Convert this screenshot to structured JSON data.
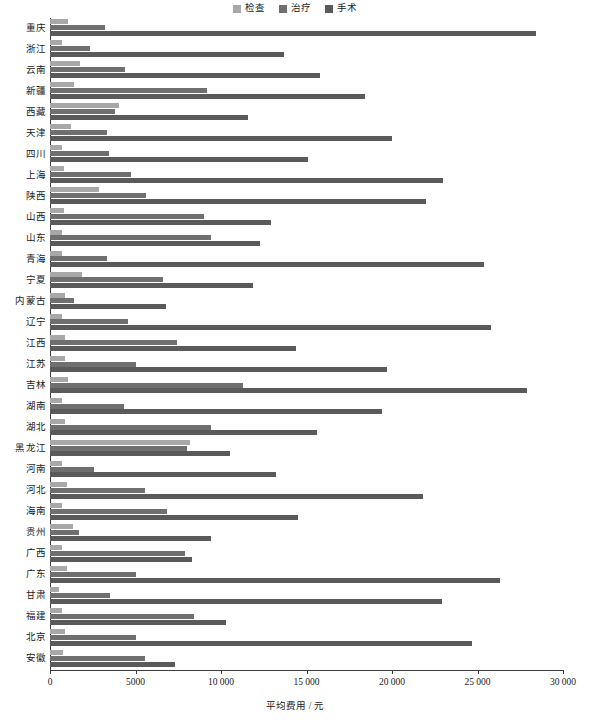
{
  "chart_data": {
    "type": "bar",
    "orientation": "horizontal",
    "grouping": "grouped",
    "title": "",
    "xlabel": "平均费用 / 元",
    "ylabel": "",
    "xlim": [
      0,
      30000
    ],
    "xticks": [
      0,
      5000,
      10000,
      15000,
      20000,
      25000,
      30000
    ],
    "xticklabels": [
      "0",
      "5000",
      "10 000",
      "15 000",
      "20 000",
      "25 000",
      "30 000"
    ],
    "grid": false,
    "legend_position": "top-center",
    "categories": [
      "重庆",
      "浙江",
      "云南",
      "新疆",
      "西藏",
      "天津",
      "四川",
      "上海",
      "陕西",
      "山西",
      "山东",
      "青海",
      "宁夏",
      "内蒙古",
      "辽宁",
      "江西",
      "江苏",
      "吉林",
      "湖南",
      "湖北",
      "黑龙江",
      "河南",
      "河北",
      "海南",
      "贵州",
      "广西",
      "广东",
      "甘肃",
      "福建",
      "北京",
      "安徽"
    ],
    "series": [
      {
        "name": "检查",
        "color": "#a8a8a8",
        "values": [
          1050,
          700,
          1750,
          1400,
          4050,
          1200,
          700,
          800,
          2850,
          800,
          700,
          700,
          1900,
          900,
          700,
          850,
          900,
          1050,
          700,
          900,
          8200,
          700,
          1000,
          700,
          1350,
          700,
          1000,
          500,
          700,
          900,
          750
        ]
      },
      {
        "name": "治疗",
        "color": "#6f6f6f",
        "values": [
          3200,
          2350,
          4400,
          9200,
          3800,
          3350,
          3450,
          4750,
          5600,
          9000,
          9400,
          3350,
          6600,
          1400,
          4550,
          7450,
          5000,
          11300,
          4350,
          9400,
          8000,
          2550,
          5550,
          6850,
          1700,
          7900,
          5000,
          3500,
          8400,
          5000,
          5550
        ]
      },
      {
        "name": "手术",
        "color": "#5a5a5a",
        "values": [
          28400,
          13700,
          15800,
          18400,
          11600,
          20000,
          15100,
          23000,
          22000,
          12900,
          12300,
          25400,
          11900,
          6800,
          25800,
          14400,
          19700,
          27900,
          19400,
          15600,
          10500,
          13200,
          21800,
          14500,
          9400,
          8300,
          26300,
          22900,
          10300,
          24700,
          7300
        ]
      }
    ]
  },
  "legend": {
    "items": [
      {
        "label": "检查",
        "color": "#a8a8a8"
      },
      {
        "label": "治疗",
        "color": "#6f6f6f"
      },
      {
        "label": "手术",
        "color": "#5a5a5a"
      }
    ]
  },
  "axis": {
    "x_title": "平均费用 / 元"
  }
}
